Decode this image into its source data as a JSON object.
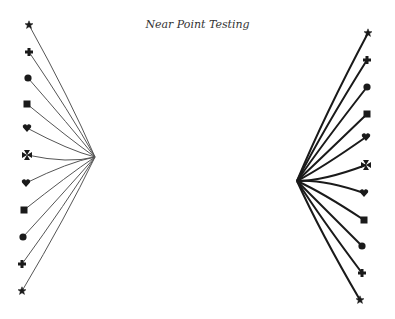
{
  "title": "Near Point Testing",
  "colors": {
    "line": "#1a1a1a",
    "light_line": "#555555",
    "background": "#ffffff"
  },
  "left_figure": {
    "convergence": [
      95,
      157
    ],
    "symbols": [
      {
        "shape": "star",
        "x": 29,
        "y": 25
      },
      {
        "shape": "plus",
        "x": 29,
        "y": 52
      },
      {
        "shape": "circle",
        "x": 28,
        "y": 78
      },
      {
        "shape": "square",
        "x": 27,
        "y": 104
      },
      {
        "shape": "heart",
        "x": 27,
        "y": 128
      },
      {
        "shape": "maltese-cross",
        "x": 27,
        "y": 155
      },
      {
        "shape": "heart",
        "x": 26,
        "y": 183
      },
      {
        "shape": "square",
        "x": 24,
        "y": 210
      },
      {
        "shape": "circle",
        "x": 23,
        "y": 237
      },
      {
        "shape": "plus",
        "x": 22,
        "y": 264
      },
      {
        "shape": "star",
        "x": 22,
        "y": 291
      }
    ]
  },
  "right_figure": {
    "convergence": [
      297,
      181
    ],
    "symbols": [
      {
        "shape": "star",
        "x": 368,
        "y": 33
      },
      {
        "shape": "plus",
        "x": 367,
        "y": 60
      },
      {
        "shape": "circle",
        "x": 367,
        "y": 87
      },
      {
        "shape": "square",
        "x": 367,
        "y": 114
      },
      {
        "shape": "heart",
        "x": 366,
        "y": 137
      },
      {
        "shape": "maltese-cross",
        "x": 366,
        "y": 165
      },
      {
        "shape": "heart",
        "x": 364,
        "y": 193
      },
      {
        "shape": "square",
        "x": 364,
        "y": 220
      },
      {
        "shape": "circle",
        "x": 362,
        "y": 246
      },
      {
        "shape": "plus",
        "x": 362,
        "y": 273
      },
      {
        "shape": "star",
        "x": 360,
        "y": 300
      }
    ]
  }
}
